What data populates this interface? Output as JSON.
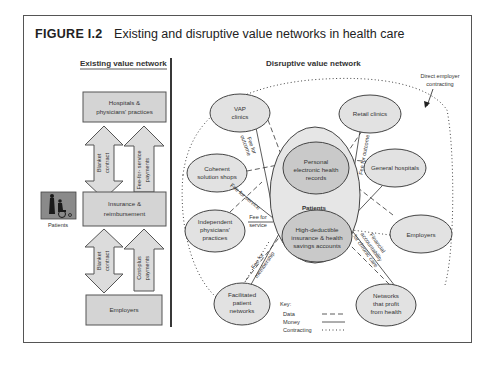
{
  "figure": {
    "label": "FIGURE I.2",
    "caption": "Existing and disruptive value networks in health care"
  },
  "existing": {
    "heading": "Existing value network",
    "boxes": {
      "hospitals": [
        "Hospitals &",
        "physicians' practices"
      ],
      "insurance": [
        "Insurance &",
        "reimbursement"
      ],
      "employers": "Employers"
    },
    "arrows": {
      "top_left": [
        "Blanket",
        "contract"
      ],
      "top_right": [
        "Fee-for- service",
        "payments"
      ],
      "bottom_left": [
        "Blanket",
        "contract"
      ],
      "bottom_right": [
        "Cost-plus",
        "payments"
      ]
    },
    "patients_icon": "wheelchair-icon",
    "patients_label": "Patients"
  },
  "disruptive": {
    "heading": "Disruptive value network",
    "direct_employer": [
      "Direct employer",
      "contracting"
    ],
    "center_label": "Patients",
    "nodes": {
      "vap": [
        "VAP",
        "clinics"
      ],
      "retail": [
        "Retail clinics"
      ],
      "coherent": [
        "Coherent",
        "solution shops"
      ],
      "phr": [
        "Personal",
        "electronic health",
        "records"
      ],
      "general": [
        "General hospitals"
      ],
      "independent": [
        "Independent",
        "physicians'",
        "practices"
      ],
      "hdhp": [
        "High-deductible",
        "insurance & health",
        "savings accounts"
      ],
      "employers": [
        "Employers"
      ],
      "facilitated": [
        "Facilitated",
        "patient",
        "networks"
      ],
      "networks_profit": [
        "Networks",
        "that profit",
        "from health"
      ]
    },
    "edge_labels": {
      "fee_outcome_vap": [
        "Fee for",
        "outcome"
      ],
      "fee_outcome_retail": "Fee for outcome",
      "fee_service_coherent": "Fee for service",
      "fee_service_independent": [
        "Fee for",
        "service"
      ],
      "fee_membership": [
        "Fee for",
        "membership"
      ],
      "financial_accountability": [
        "Financial",
        "accountability",
        "for chronic care"
      ]
    }
  },
  "key": {
    "title": "Key:",
    "items": [
      {
        "label": "Data",
        "style": "dashed"
      },
      {
        "label": "Money",
        "style": "solid"
      },
      {
        "label": "Contracting",
        "style": "dotted"
      }
    ]
  }
}
